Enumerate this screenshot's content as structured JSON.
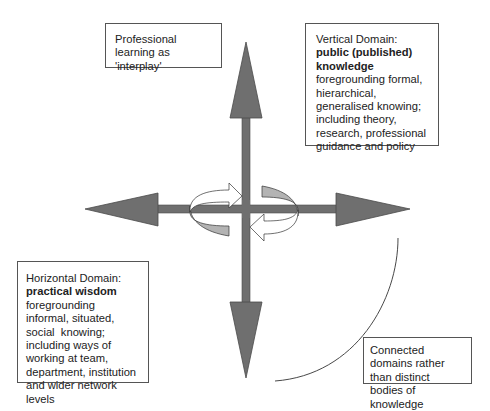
{
  "diagram": {
    "title_box": {
      "text": "Professional learning as 'interplay'"
    },
    "vertical_box": {
      "prefix": "Vertical Domain: ",
      "bold": "public (published) knowledge",
      "body": "foregrounding formal, hierarchical, generalised knowing; including theory, research, professional guidance and policy"
    },
    "horizontal_box": {
      "prefix": "Horizontal Domain:",
      "bold": "practical wisdom",
      "body": "foregrounding  informal, situated, social  knowing; including ways of working at team, department, institution and wider network levels"
    },
    "connected_box": {
      "text": "Connected domains rather than distinct bodies of knowledge"
    },
    "colors": {
      "arrow_fill": "#6f6f6f",
      "arrow_stroke": "#4a4a4a",
      "curl_fill": "#b3b3b3",
      "line": "#333333"
    }
  }
}
